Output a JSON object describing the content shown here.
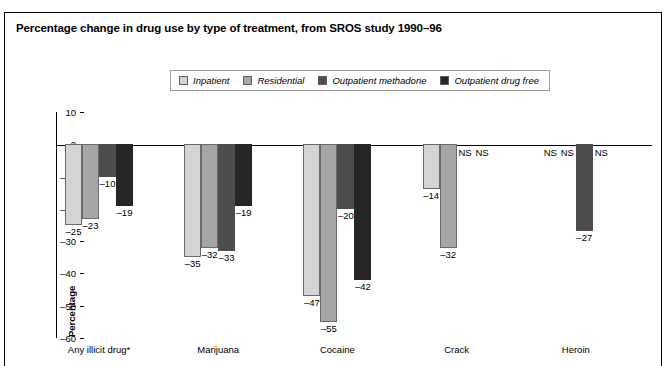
{
  "title": "Percentage change in drug use by type of treatment, from SROS study 1990–96",
  "legend": {
    "position": "top-center",
    "items": [
      {
        "label": "Inpatient",
        "color": "#d4d4d4"
      },
      {
        "label": "Residential",
        "color": "#a6a6a6"
      },
      {
        "label": "Outpatient methadone",
        "color": "#4d4d4d"
      },
      {
        "label": "Outpatient drug free",
        "color": "#262626"
      }
    ]
  },
  "chart_data": {
    "type": "bar",
    "title": "Percentage change in drug use by type of treatment, from SROS study 1990–96",
    "xlabel": "",
    "ylabel": "Percentage",
    "ylim": [
      -60,
      10
    ],
    "yticks": [
      10,
      0,
      -10,
      -20,
      -30,
      -40,
      -50,
      -60
    ],
    "ytick_labels": [
      "10",
      "0",
      "–10",
      "–20",
      "–30",
      "–40",
      "–50",
      "–60"
    ],
    "grid": false,
    "categories": [
      "Any illicit drug*",
      "Marijuana",
      "Cocaine",
      "Crack",
      "Heroin"
    ],
    "not_significant_marker": "NS",
    "series": [
      {
        "name": "Inpatient",
        "color": "#d4d4d4",
        "values": [
          -25,
          -35,
          -47,
          -14,
          null
        ],
        "labels": [
          "–25",
          "–35",
          "–47",
          "–14",
          "NS"
        ]
      },
      {
        "name": "Residential",
        "color": "#a6a6a6",
        "values": [
          -23,
          -32,
          -55,
          -32,
          null
        ],
        "labels": [
          "–23",
          "–32",
          "–55",
          "–32",
          "NS"
        ]
      },
      {
        "name": "Outpatient methadone",
        "color": "#4d4d4d",
        "values": [
          -10,
          -33,
          -20,
          null,
          -27
        ],
        "labels": [
          "–10",
          "–33",
          "–20",
          "NS",
          "–27"
        ]
      },
      {
        "name": "Outpatient drug free",
        "color": "#262626",
        "values": [
          -19,
          -19,
          -42,
          null,
          null
        ],
        "labels": [
          "–19",
          "–19",
          "–42",
          "NS",
          "NS"
        ]
      }
    ]
  }
}
